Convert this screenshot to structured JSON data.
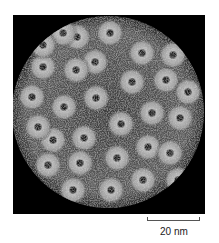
{
  "figure": {
    "background_color": "#000000",
    "capsid_color": "#c8c8c8",
    "capsid": {
      "cx": 95,
      "cy": 97,
      "r": 96
    },
    "capsomers": [
      {
        "x": 82,
        "y": 47
      },
      {
        "x": 119,
        "y": 67
      },
      {
        "x": 63,
        "y": 55
      },
      {
        "x": 83,
        "y": 83
      },
      {
        "x": 51,
        "y": 92
      },
      {
        "x": 108,
        "y": 109
      },
      {
        "x": 71,
        "y": 123
      },
      {
        "x": 40,
        "y": 125
      },
      {
        "x": 139,
        "y": 98
      },
      {
        "x": 153,
        "y": 65
      },
      {
        "x": 129,
        "y": 38
      },
      {
        "x": 97,
        "y": 18
      },
      {
        "x": 64,
        "y": 22
      },
      {
        "x": 30,
        "y": 52
      },
      {
        "x": 19,
        "y": 82
      },
      {
        "x": 25,
        "y": 112
      },
      {
        "x": 67,
        "y": 148
      },
      {
        "x": 104,
        "y": 143
      },
      {
        "x": 135,
        "y": 132
      },
      {
        "x": 157,
        "y": 138
      },
      {
        "x": 167,
        "y": 103
      },
      {
        "x": 175,
        "y": 77
      },
      {
        "x": 50,
        "y": 18
      },
      {
        "x": 160,
        "y": 40
      },
      {
        "x": 35,
        "y": 150
      },
      {
        "x": 98,
        "y": 175
      },
      {
        "x": 130,
        "y": 165
      },
      {
        "x": 165,
        "y": 165
      },
      {
        "x": 60,
        "y": 175
      },
      {
        "x": 30,
        "y": 30
      }
    ]
  },
  "scale_bar": {
    "label": "20 nm",
    "length_px": 53
  }
}
